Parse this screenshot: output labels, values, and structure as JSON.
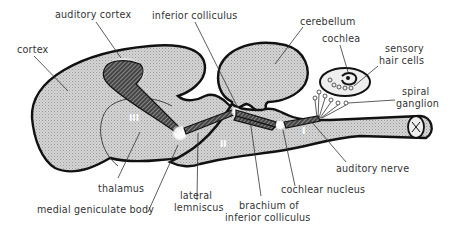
{
  "labels": {
    "auditory_cortex": "auditory cortex",
    "inferior_colliculus": "inferior colliculus",
    "cerebellum": "cerebellum",
    "cochlea": "cochlea",
    "sensory_hair_cells_1": "sensory",
    "sensory_hair_cells_2": "hair cells",
    "spiral_ganglion_1": "spiral",
    "spiral_ganglion_2": "ganglion",
    "cortex": "cortex",
    "thalamus": "thalamus",
    "medial_geniculate_body": "medial geniculate body",
    "lateral_lemniscus_1": "lateral",
    "lateral_lemniscus_2": "lemniscus",
    "brachium_1": "brachium of",
    "brachium_2": "inferior colliculus",
    "cochlear_nucleus": "cochlear nucleus",
    "auditory_nerve": "auditory nerve"
  },
  "pathway_stages": {
    "first": "I",
    "second": "II",
    "third": "III"
  },
  "colors": {
    "tissue_fill": "#c8c8c8",
    "outline": "#111111",
    "label_text": "#333333",
    "highlight": "#ffffff"
  }
}
